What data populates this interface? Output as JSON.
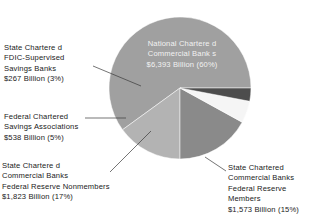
{
  "chart_data": {
    "type": "pie",
    "title": "",
    "subtitle": "",
    "xlabel": "",
    "ylabel": "",
    "legend_position": "callout-labels",
    "grid": false,
    "unit": "Billion",
    "currency": "$",
    "categories": [
      "National Chartered Commercial Banks",
      "State Chartered Commercial Banks Federal Reserve Members",
      "State Chartered Commercial Banks Federal Reserve Nonmembers",
      "Federal Chartered Savings Associations",
      "State Chartered FDIC-Supervised Savings Banks"
    ],
    "values": [
      6393,
      1573,
      1823,
      538,
      267
    ],
    "percentages": [
      60,
      15,
      17,
      5,
      3
    ],
    "colors": [
      "#a0a0a0",
      "#b3b3b3",
      "#8a8a8a",
      "#f5f5f5",
      "#4d4d4d"
    ],
    "slices": [
      {
        "name": "national-chartered-commercial-banks",
        "label": "National Chartered Commercial Banks",
        "value": 6393,
        "percent": 60,
        "value_text": "$6,393 Billion (60%)",
        "color": "#a0a0a0",
        "start_deg": 0,
        "sweep_deg": 216
      },
      {
        "name": "state-chartered-commercial-banks-fed-reserve-members",
        "label": "State Chartered Commercial Banks Federal Reserve Members",
        "value": 1573,
        "percent": 15,
        "value_text": "$1,573 Billion (15%)",
        "color": "#b3b3b3",
        "start_deg": 216,
        "sweep_deg": 54
      },
      {
        "name": "state-chartered-commercial-banks-fed-reserve-nonmembers",
        "label": "State Chartered Commercial Banks Federal Reserve Nonmembers",
        "value": 1823,
        "percent": 17,
        "value_text": "$1,823 Billion (17%)",
        "color": "#8a8a8a",
        "start_deg": 270,
        "sweep_deg": 61.2
      },
      {
        "name": "federal-chartered-savings-associations",
        "label": "Federal Chartered Savings Associations",
        "value": 538,
        "percent": 5,
        "value_text": "$538 Billion (5%)",
        "color": "#f5f5f5",
        "start_deg": 331.2,
        "sweep_deg": 18
      },
      {
        "name": "state-chartered-fdic-supervised-savings-banks",
        "label": "State Chartered FDIC-Supervised Savings Banks",
        "value": 267,
        "percent": 3,
        "value_text": "$267 Billion (3%)",
        "color": "#4d4d4d",
        "start_deg": 349.2,
        "sweep_deg": 10.8
      }
    ]
  },
  "inner_label": {
    "line1": "National Chartere d",
    "line2": "Commercial Bank s",
    "line3": "$6,393 Billion (60%)"
  },
  "callouts": {
    "fdic_savings_banks": {
      "line1": "State Chartere d",
      "line2": "FDIC-Supervised",
      "line3": "Savings Banks",
      "line4": "$267 Billion (3%)"
    },
    "federal_savings_associations": {
      "line1": "Federal Chartered",
      "line2": "Savings Associations",
      "line3": "$538 Billion (5%)"
    },
    "nonmembers": {
      "line1": "State Chartere d",
      "line2": "Commercial Banks",
      "line3": "Federal Reserve Nonmembers",
      "line4": "$1,823 Billion (17%)"
    },
    "members": {
      "line1": "State Chartered",
      "line2": "Commercial Banks",
      "line3": "Federal Reserve",
      "line4": "Members",
      "line5": "$1,573 Billion (15%)"
    }
  }
}
